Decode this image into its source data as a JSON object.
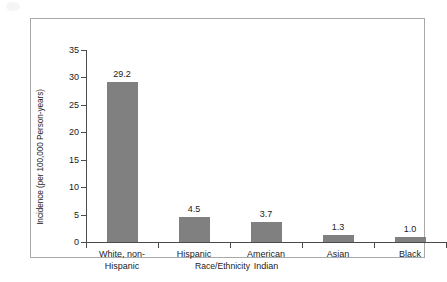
{
  "chart_data": {
    "type": "bar",
    "title": "",
    "xlabel": "Race/Ethnicity",
    "ylabel": "Incidence (per 100,000 Person-years)",
    "categories": [
      "White, non-Hispanic",
      "Hispanic",
      "American Indian",
      "Asian",
      "Black"
    ],
    "category_lines": [
      [
        "White, non-",
        "Hispanic"
      ],
      [
        "Hispanic"
      ],
      [
        "American",
        "Indian"
      ],
      [
        "Asian"
      ],
      [
        "Black"
      ]
    ],
    "values": [
      29.2,
      4.5,
      3.7,
      1.3,
      1.0
    ],
    "value_labels": [
      "29.2",
      "4.5",
      "3.7",
      "1.3",
      "1.0"
    ],
    "ylim": [
      0,
      35
    ],
    "ytick_step": 5,
    "yticks": [
      0,
      5,
      10,
      15,
      20,
      25,
      30,
      35
    ],
    "ytick_labels": [
      "0",
      "5",
      "10",
      "15",
      "20",
      "25",
      "30",
      "35"
    ],
    "grid": false,
    "legend": false,
    "bar_color": "#808080",
    "axis_color": "#4b4b4b",
    "frame_color": "#a9a9a9",
    "background_color": "#ffffff"
  }
}
